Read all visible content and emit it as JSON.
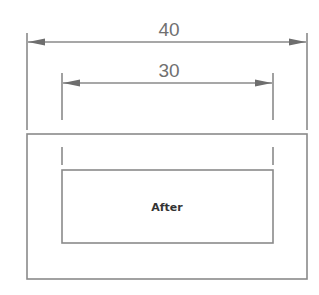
{
  "diagram": {
    "outer_dimension": {
      "label": "40"
    },
    "inner_dimension": {
      "label": "30"
    },
    "outer_box": {
      "label": ""
    },
    "inner_box": {
      "label": "After"
    }
  },
  "colors": {
    "line": "#8a8a8a",
    "text": "#707070",
    "label": "#333333",
    "background": "#ffffff"
  }
}
